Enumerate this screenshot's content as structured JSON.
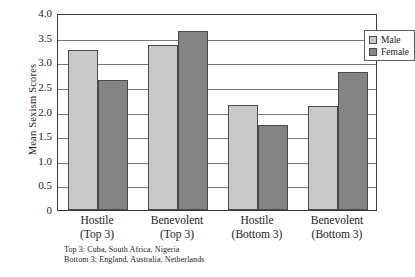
{
  "chart_data": {
    "type": "bar",
    "title": "",
    "xlabel": "",
    "ylabel": "Mean Sexism Scores",
    "ylim": [
      0,
      4.0
    ],
    "ytick_labels": [
      "4.0",
      "3.5",
      "3.0",
      "2.5",
      "2.0",
      "1.5",
      "1.0",
      "0.5",
      "0"
    ],
    "ytick_values": [
      4.0,
      3.5,
      3.0,
      2.5,
      2.0,
      1.5,
      1.0,
      0.5,
      0
    ],
    "grid": "horizontal",
    "legend_position": "top-right",
    "categories": [
      "Hostile (Top 3)",
      "Benevolent (Top 3)",
      "Hostile (Bottom 3)",
      "Benevolent (Bottom 3)"
    ],
    "category_lines": [
      {
        "line1": "Hostile",
        "line2": "(Top 3)"
      },
      {
        "line1": "Benevolent",
        "line2": "(Top 3)"
      },
      {
        "line1": "Hostile",
        "line2": "(Bottom 3)"
      },
      {
        "line1": "Benevolent",
        "line2": "(Bottom 3)"
      }
    ],
    "series": [
      {
        "name": "Male",
        "color": "#c9c9c9",
        "values": [
          3.25,
          3.35,
          2.13,
          2.12
        ]
      },
      {
        "name": "Female",
        "color": "#848484",
        "values": [
          2.63,
          3.63,
          1.73,
          2.8
        ]
      }
    ],
    "annotations": [
      "Top 3: Cuba, South Africa, Nigeria",
      "Bottom 3: England, Australia, Netherlands"
    ]
  },
  "legend": {
    "items": [
      {
        "label": "Male"
      },
      {
        "label": "Female"
      }
    ]
  },
  "footnotes": {
    "top": "Top 3: Cuba, South Africa, Nigeria",
    "bottom": "Bottom 3: England, Australia, Netherlands"
  }
}
